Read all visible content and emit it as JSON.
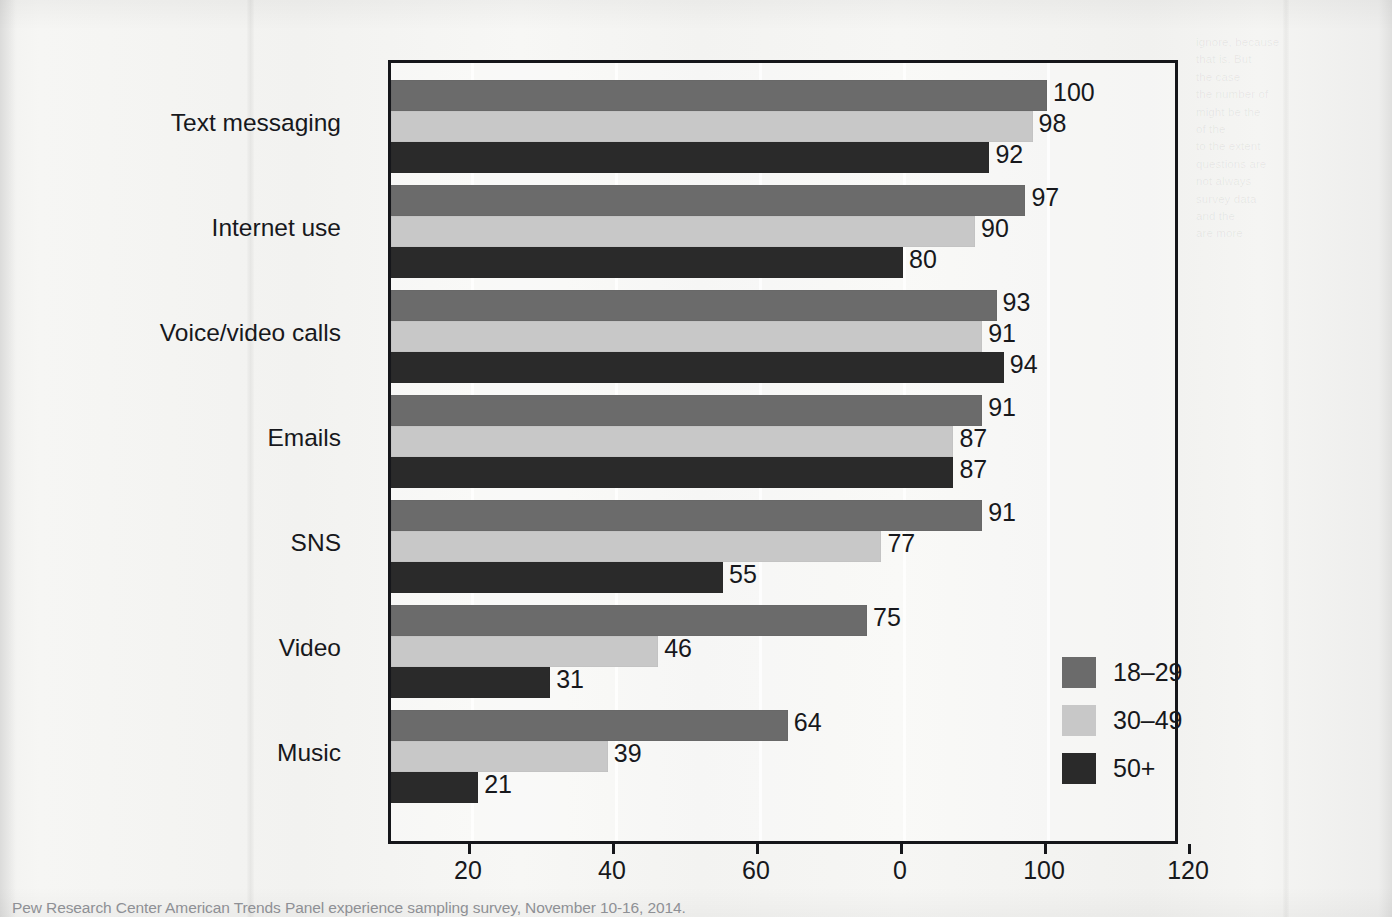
{
  "chart_data": {
    "type": "bar",
    "orientation": "horizontal",
    "grouped": true,
    "title": "",
    "xlabel": "",
    "ylabel": "",
    "xlim": [
      0,
      120
    ],
    "xticks": [
      20,
      40,
      60,
      0,
      100,
      120
    ],
    "xtick_labels": [
      "20",
      "40",
      "60",
      "0",
      "100",
      "120"
    ],
    "grid": true,
    "legend_position": "inside-right",
    "categories": [
      "Text messaging",
      "Internet use",
      "Voice/video calls",
      "Emails",
      "SNS",
      "Video",
      "Music"
    ],
    "series": [
      {
        "name": "18–29",
        "color": "#6b6b6b",
        "values": [
          100,
          97,
          93,
          91,
          91,
          75,
          64
        ]
      },
      {
        "name": "30–49",
        "color": "#c8c8c8",
        "values": [
          98,
          90,
          91,
          87,
          77,
          46,
          39
        ]
      },
      {
        "name": "50+",
        "color": "#2a2a2a",
        "values": [
          92,
          80,
          94,
          87,
          55,
          31,
          21
        ]
      }
    ],
    "value_labels": [
      [
        "100",
        "98",
        "92"
      ],
      [
        "97",
        "90",
        "80"
      ],
      [
        "93",
        "91",
        "94"
      ],
      [
        "91",
        "87",
        "87"
      ],
      [
        "91",
        "77",
        "55"
      ],
      [
        "75",
        "46",
        "31"
      ],
      [
        "64",
        "39",
        "21"
      ]
    ]
  },
  "legend": {
    "items": [
      {
        "label": "18–29",
        "color": "#6b6b6b"
      },
      {
        "label": "30–49",
        "color": "#c8c8c8"
      },
      {
        "label": "50+",
        "color": "#2a2a2a"
      }
    ]
  },
  "source": {
    "text": "Pew Research Center American Trends Panel experience sampling survey, November 10-16, 2014."
  },
  "background": {
    "page_color": "#f4f4f2",
    "showthrough_text": "ignore, because\nthat is. But\nthe case\nthe number of\nmight be the\nof the\nto the extent\nquestions are\nnot always\nsurvey data\nand the\nare more"
  }
}
